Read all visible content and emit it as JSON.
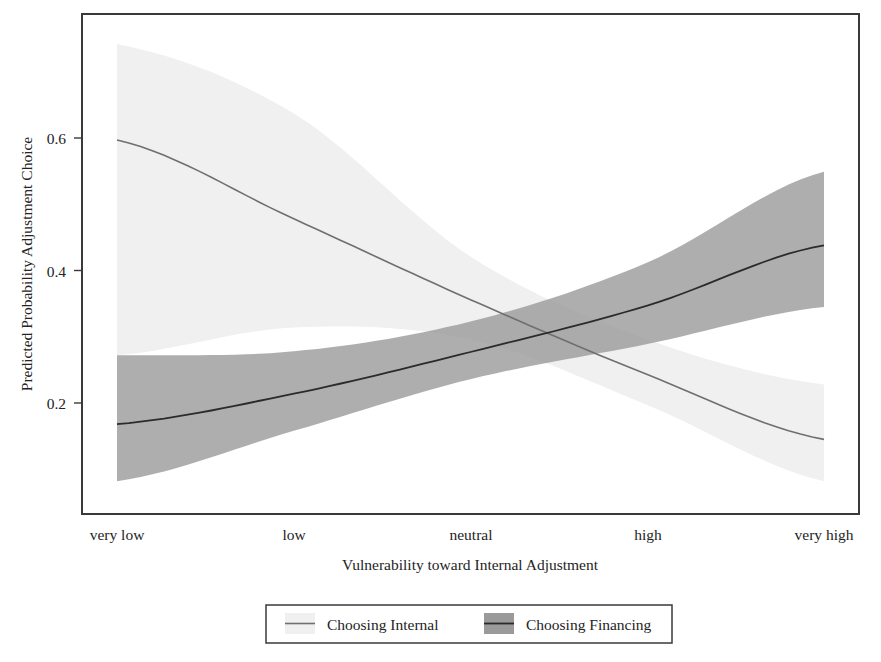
{
  "chart_data": {
    "type": "line",
    "title": "",
    "xlabel": "Vulnerability toward Internal Adjustment",
    "ylabel": "Predicted Probability Adjustment Choice",
    "x_categories": [
      "very low",
      "low",
      "neutral",
      "high",
      "very high"
    ],
    "x_numeric": [
      1,
      2,
      3,
      4,
      5
    ],
    "xlim": [
      0.8,
      5.2
    ],
    "ylim": [
      0.03,
      0.79
    ],
    "y_ticks": [
      "0.2",
      "0.4",
      "0.6"
    ],
    "y_tick_values": [
      0.2,
      0.4,
      0.6
    ],
    "grid": true,
    "legend_position": "bottom-center",
    "series": [
      {
        "name": "Choosing Internal",
        "color": "#f0f0f0",
        "line_color": "#6b6b6b",
        "band_color": "#f1f1f1",
        "values": [
          0.597,
          0.478,
          0.356,
          0.243,
          0.145
        ],
        "ci_lower": [
          0.272,
          0.314,
          0.296,
          0.197,
          0.082
        ],
        "ci_upper": [
          0.742,
          0.637,
          0.421,
          0.296,
          0.228
        ]
      },
      {
        "name": "Choosing Financing",
        "color": "#9a9a9a",
        "line_color": "#2e2e2e",
        "band_color": "#9d9d9d",
        "values": [
          0.168,
          0.214,
          0.277,
          0.347,
          0.438
        ],
        "ci_lower": [
          0.082,
          0.158,
          0.236,
          0.289,
          0.345
        ],
        "ci_upper": [
          0.272,
          0.278,
          0.323,
          0.412,
          0.549
        ]
      }
    ]
  },
  "axes": {
    "y_label": "Predicted Probability Adjustment Choice",
    "x_label": "Vulnerability toward Internal Adjustment",
    "y_tick_0": "0.2",
    "y_tick_1": "0.4",
    "y_tick_2": "0.6",
    "x_tick_0": "very low",
    "x_tick_1": "low",
    "x_tick_2": "neutral",
    "x_tick_3": "high",
    "x_tick_4": "very high"
  },
  "legend": {
    "entry_0_label": "Choosing Internal",
    "entry_1_label": "Choosing Financing"
  },
  "colors": {
    "frame": "#3a3a3a",
    "grid": "#cfcfcf",
    "internal_band": "#f1f1f1",
    "internal_line": "#6f6f6f",
    "financing_band": "#9d9d9d",
    "financing_line": "#2b2b2b",
    "text": "#242424",
    "background": "#ffffff"
  }
}
